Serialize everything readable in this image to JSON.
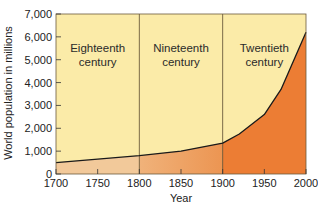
{
  "chart_data": {
    "type": "area",
    "title": "",
    "xlabel": "Year",
    "ylabel": "World population in millions",
    "xlim": [
      1700,
      2000
    ],
    "ylim": [
      0,
      7000
    ],
    "x_ticks": [
      1700,
      1750,
      1800,
      1850,
      1900,
      1950,
      2000
    ],
    "x_tick_labels": [
      "1700",
      "1750",
      "1800",
      "1850",
      "1900",
      "1950",
      "2000"
    ],
    "y_ticks": [
      0,
      1000,
      2000,
      3000,
      4000,
      5000,
      6000,
      7000
    ],
    "y_tick_labels": [
      "0",
      "1,000",
      "2,000",
      "3,000",
      "4,000",
      "5,000",
      "6,000",
      "7,000"
    ],
    "grid": false,
    "legend": null,
    "series": [
      {
        "name": "World population",
        "x": [
          1700,
          1750,
          1800,
          1850,
          1900,
          1920,
          1950,
          1970,
          2000
        ],
        "values": [
          500,
          650,
          800,
          1000,
          1350,
          1750,
          2600,
          3700,
          6200
        ]
      }
    ],
    "regions": [
      {
        "label_line1": "Eighteenth",
        "label_line2": "century",
        "from": 1700,
        "to": 1800,
        "fill": "#f2c99a"
      },
      {
        "label_line1": "Nineteenth",
        "label_line2": "century",
        "from": 1800,
        "to": 1900,
        "fill": "#eea266"
      },
      {
        "label_line1": "Twentieth",
        "label_line2": "century",
        "from": 1900,
        "to": 2000,
        "fill": "#ec7d34"
      }
    ],
    "background_color": "#fbeba8",
    "line_color": "#1a1a1a"
  }
}
